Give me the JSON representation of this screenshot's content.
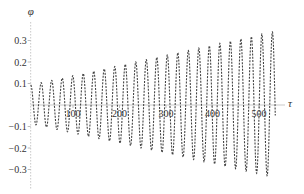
{
  "chart_data": {
    "type": "line",
    "title": "",
    "xlabel": "τ",
    "ylabel": "φ",
    "x_ticks": [
      100,
      200,
      300,
      400,
      500
    ],
    "x_tick_labels": [
      "100",
      "200",
      "300",
      "400",
      "500"
    ],
    "y_ticks": [
      0.3,
      0.2,
      0.1,
      -0.1,
      -0.2,
      -0.3
    ],
    "y_tick_labels": [
      "0.3",
      "0.2",
      "0.1",
      "−0.1",
      "−0.2",
      "−0.3"
    ],
    "xlim": [
      9,
      535
    ],
    "ylim": [
      -0.37,
      0.4
    ],
    "grid": false,
    "legend": null,
    "line_style": "dashed",
    "line_color": "#444444",
    "axis_color": "#bbbbbb",
    "series": [
      {
        "name": "φ(τ)",
        "description": "oscillation with linearly growing amplitude",
        "period": 22.6,
        "amplitude_start": 0.09,
        "amplitude_end": 0.34,
        "tau_start": 9,
        "tau_end": 535,
        "phase_start": "peak",
        "peaks": [
          [
            9,
            0.1
          ],
          [
            216,
            0.19
          ],
          [
            522,
            0.335
          ]
        ],
        "troughs": [
          [
            19,
            -0.09
          ],
          [
            276,
            -0.22
          ],
          [
            510,
            -0.34
          ]
        ],
        "end_value": -0.12
      }
    ]
  }
}
